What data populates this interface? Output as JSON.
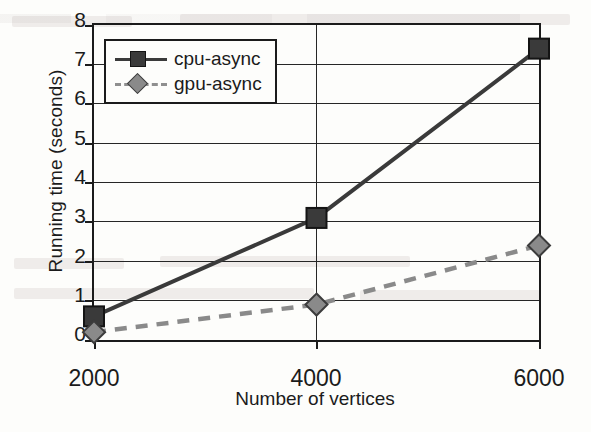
{
  "chart_data": {
    "type": "line",
    "title": "",
    "xlabel": "Number of vertices",
    "ylabel": "Running time (seconds)",
    "categories": [
      "2000",
      "4000",
      "6000"
    ],
    "x": [
      2000,
      4000,
      6000
    ],
    "xlim": [
      2000,
      6000
    ],
    "ylim": [
      0,
      8
    ],
    "yticks": [
      "0",
      "1",
      "2",
      "3",
      "4",
      "5",
      "6",
      "7",
      "8"
    ],
    "grid": "horizontal",
    "legend_position": "top-left inside plot area",
    "series": [
      {
        "name": "cpu-async",
        "values": [
          0.6,
          3.1,
          7.4
        ],
        "marker": "square",
        "line_style": "solid",
        "color": "#3a3a3a"
      },
      {
        "name": "gpu-async",
        "values": [
          0.2,
          0.9,
          2.4
        ],
        "marker": "diamond",
        "line_style": "dashed",
        "color": "#8a8a8a"
      }
    ]
  },
  "legend": {
    "entries": [
      {
        "label": "cpu-async"
      },
      {
        "label": "gpu-async"
      }
    ]
  },
  "colors": {
    "cpu_async": "#3a3a3a",
    "gpu_async": "#8a8a8a",
    "axis": "#1b1b1b",
    "gridline": "#262626",
    "background": "#fdfdfb"
  }
}
